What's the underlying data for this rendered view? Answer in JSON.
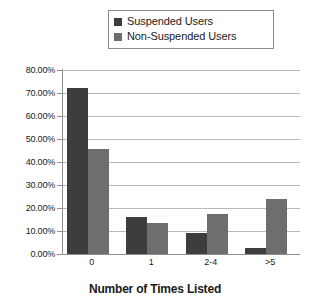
{
  "chart_data": {
    "type": "bar",
    "title": "",
    "xlabel": "Number of Times Listed",
    "ylabel": "",
    "categories": [
      "0",
      "1",
      "2-4",
      ">5"
    ],
    "series": [
      {
        "name": "Suspended Users",
        "color": "#3d3d3d",
        "values": [
          72.0,
          16.2,
          9.0,
          2.5
        ]
      },
      {
        "name": "Non-Suspended Users",
        "color": "#6e6e6e",
        "values": [
          45.6,
          13.4,
          17.2,
          24.0
        ]
      }
    ],
    "ylim": [
      0,
      80
    ],
    "ytick_step": 10,
    "ytick_labels": [
      "80.00%",
      "70.00%",
      "60.00%",
      "50.00%",
      "40.00%",
      "30.00%",
      "20.00%",
      "10.00%",
      "0.00%"
    ],
    "ytick_values": [
      80,
      70,
      60,
      50,
      40,
      30,
      20,
      10,
      0
    ],
    "grid": true,
    "legend_position": "top-center",
    "value_suffix": "%"
  },
  "legend": {
    "items": [
      {
        "label": "Suspended Users",
        "color": "#3d3d3d"
      },
      {
        "label": "Non-Suspended Users",
        "color": "#6e6e6e"
      }
    ]
  },
  "axis": {
    "x_title": "Number of Times Listed"
  }
}
